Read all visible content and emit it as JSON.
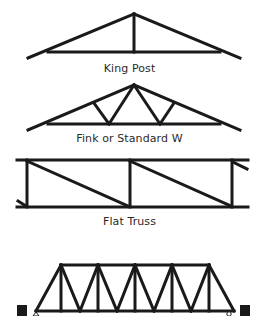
{
  "diagram": {
    "stroke_color": "#1a1a1a",
    "background": "#ffffff",
    "trusses": [
      {
        "id": "king-post",
        "label": "King Post",
        "label_y": 62
      },
      {
        "id": "fink",
        "label": "Fink or Standard W",
        "label_y": 132
      },
      {
        "id": "flat",
        "label": "Flat Truss",
        "label_y": 215
      },
      {
        "id": "bridge",
        "label": "",
        "label_y": null
      }
    ]
  }
}
